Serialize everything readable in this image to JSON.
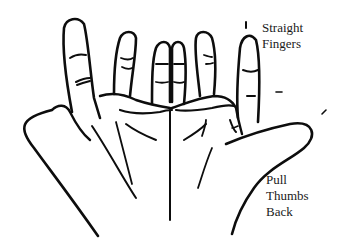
{
  "diagram": {
    "labels": {
      "top": {
        "line1": "Straight",
        "line2": "Fingers"
      },
      "bottom": {
        "line1": "Pull",
        "line2": "Thumbs",
        "line3": "Back"
      }
    },
    "colors": {
      "ink": "#0d0d0d",
      "background": "#ffffff",
      "text": "#1a1a1a"
    }
  }
}
